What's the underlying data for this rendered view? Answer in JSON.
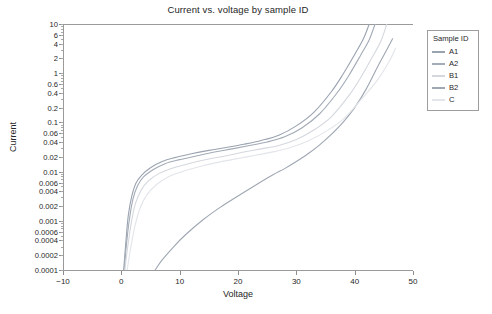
{
  "chart_data": {
    "type": "line",
    "title": "Current vs. voltage by sample ID",
    "xlabel": "Voltage",
    "ylabel": "Current",
    "xlim": [
      -10,
      50
    ],
    "ylim": [
      0.0001,
      10
    ],
    "yscale": "log",
    "grid": false,
    "legend_position": "right-outside",
    "legend_title": "Sample ID",
    "xticks": [
      -10,
      0,
      10,
      20,
      30,
      40,
      50
    ],
    "xtick_labels": [
      "-10",
      "0",
      "10",
      "20",
      "30",
      "40",
      "50"
    ],
    "yticks": [
      10,
      6,
      4,
      2,
      1,
      0.6,
      0.4,
      0.2,
      0.1,
      0.06,
      0.04,
      0.02,
      0.01,
      0.006,
      0.004,
      0.002,
      0.001,
      0.0006,
      0.0004,
      0.0002,
      0.0001
    ],
    "ytick_labels": [
      "10",
      "6",
      "4",
      "2",
      "1",
      "0.6",
      "0.4",
      "0.2",
      "0.1",
      "0.06",
      "0.04",
      "0.02",
      "0.01",
      "0.006",
      "0.004",
      "0.002",
      "0.001",
      "0.0006",
      "0.0004",
      "0.0002",
      "0.0001"
    ],
    "series": [
      {
        "name": "A1",
        "color": "#9aa3b0",
        "x": [
          0.4,
          0.8,
          1.2,
          1.8,
          2.5,
          3.5,
          5,
          7,
          9,
          12,
          15,
          18,
          21,
          24,
          27,
          30,
          33,
          36,
          38,
          40,
          41.5,
          42.5
        ],
        "y": [
          0.0001,
          0.0004,
          0.0013,
          0.0032,
          0.0058,
          0.0085,
          0.012,
          0.016,
          0.019,
          0.023,
          0.027,
          0.031,
          0.036,
          0.043,
          0.055,
          0.085,
          0.16,
          0.42,
          0.95,
          2.4,
          5.0,
          10
        ]
      },
      {
        "name": "A2",
        "color": "#a3abb6",
        "x": [
          0.5,
          0.9,
          1.4,
          2.0,
          2.8,
          3.8,
          5.5,
          7.5,
          10,
          13,
          16,
          19,
          22,
          25,
          28,
          31,
          34,
          37,
          39,
          41,
          42.5,
          43.5
        ],
        "y": [
          0.0001,
          0.00035,
          0.0011,
          0.0028,
          0.0052,
          0.0078,
          0.011,
          0.0145,
          0.0175,
          0.021,
          0.025,
          0.029,
          0.034,
          0.04,
          0.051,
          0.078,
          0.15,
          0.4,
          0.9,
          2.3,
          4.8,
          10
        ]
      },
      {
        "name": "B1",
        "color": "#d4d8de",
        "x": [
          0.6,
          1.1,
          1.7,
          2.4,
          3.4,
          4.6,
          6.5,
          9,
          12,
          15,
          18,
          21,
          24,
          27,
          30,
          33,
          36,
          39,
          41,
          43,
          44.5,
          45.5
        ],
        "y": [
          0.0001,
          0.0003,
          0.0009,
          0.0022,
          0.0042,
          0.0064,
          0.0092,
          0.012,
          0.015,
          0.018,
          0.021,
          0.025,
          0.029,
          0.034,
          0.045,
          0.07,
          0.13,
          0.35,
          0.8,
          2.1,
          4.5,
          10
        ]
      },
      {
        "name": "B2",
        "color": "#9fa7b3",
        "x": [
          5.8,
          7,
          9,
          11,
          14,
          17,
          20,
          23,
          26,
          28,
          30,
          32,
          34,
          36,
          38,
          40,
          42,
          44,
          45.5,
          46.5
        ],
        "y": [
          0.0001,
          0.00016,
          0.0003,
          0.00052,
          0.00105,
          0.0019,
          0.0032,
          0.0053,
          0.0086,
          0.0115,
          0.016,
          0.023,
          0.035,
          0.057,
          0.1,
          0.2,
          0.48,
          1.4,
          3.0,
          5.0
        ]
      },
      {
        "name": "C",
        "color": "#e2e5e9",
        "x": [
          1.0,
          1.6,
          2.3,
          3.2,
          4.4,
          6,
          8,
          11,
          14,
          17,
          20,
          23,
          26,
          29,
          32,
          35,
          38,
          41,
          44,
          46,
          47
        ],
        "y": [
          0.0001,
          0.00028,
          0.00075,
          0.0018,
          0.0034,
          0.0054,
          0.0078,
          0.0105,
          0.0132,
          0.0158,
          0.0185,
          0.0215,
          0.0252,
          0.031,
          0.042,
          0.065,
          0.115,
          0.28,
          0.75,
          1.8,
          3.2
        ]
      }
    ]
  }
}
